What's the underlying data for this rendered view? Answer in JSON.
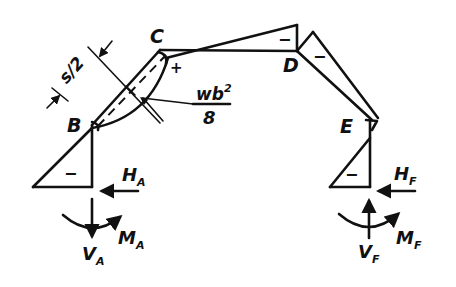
{
  "diagram": {
    "type": "frame bending moment diagram",
    "nodes": {
      "B": "B",
      "C": "C",
      "D": "D",
      "E": "E"
    },
    "signs": {
      "left_column": "−",
      "CD_member": "−",
      "DE_member": "−",
      "right_column": "−",
      "C_corner": "+"
    },
    "dimension": {
      "label_s": "s/2"
    },
    "moment_label": {
      "numerator": "wb²",
      "numerator_base": "wb",
      "numerator_exp": "2",
      "denominator": "8"
    },
    "reactions_left": {
      "H": "H",
      "H_sub": "A",
      "M": "M",
      "M_sub": "A",
      "V": "V",
      "V_sub": "A"
    },
    "reactions_right": {
      "H": "H",
      "H_sub": "F",
      "M": "M",
      "M_sub": "F",
      "V": "V",
      "V_sub": "F"
    }
  }
}
